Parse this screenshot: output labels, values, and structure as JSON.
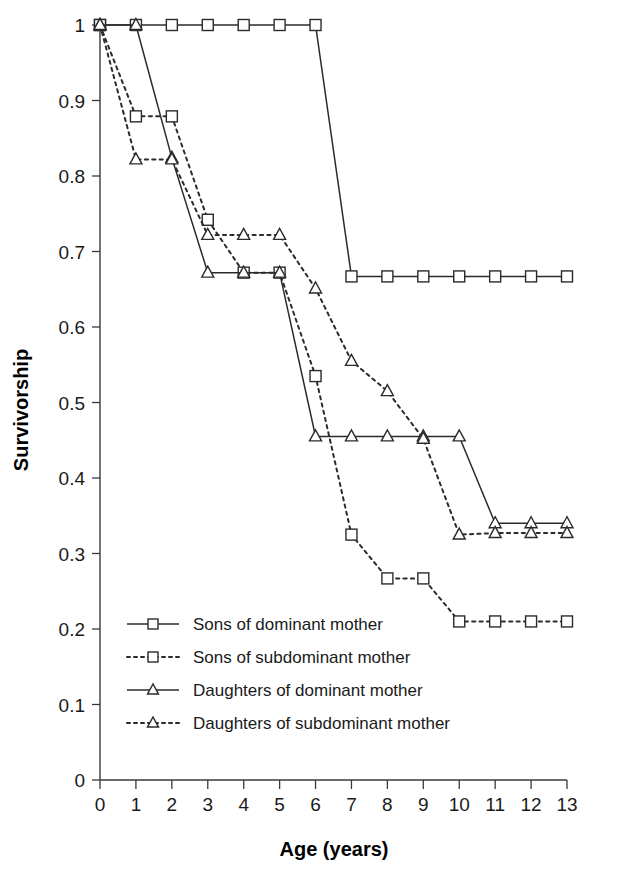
{
  "chart_data": {
    "type": "line",
    "title": "",
    "xlabel": "Age (years)",
    "ylabel": "Survivorship",
    "xlim": [
      0,
      13
    ],
    "ylim": [
      0,
      1
    ],
    "xticks": [
      "0",
      "1",
      "2",
      "3",
      "4",
      "5",
      "6",
      "7",
      "8",
      "9",
      "10",
      "11",
      "12",
      "13"
    ],
    "yticks": [
      "0",
      "0.1",
      "0.2",
      "0.3",
      "0.4",
      "0.5",
      "0.6",
      "0.7",
      "0.8",
      "0.9",
      "1"
    ],
    "grid": false,
    "legend_position": "inside lower left",
    "x": [
      0,
      1,
      2,
      3,
      4,
      5,
      6,
      7,
      8,
      9,
      10,
      11,
      12,
      13
    ],
    "series": [
      {
        "name": "Sons of dominant mother",
        "marker": "square",
        "linestyle": "solid",
        "values": [
          1.0,
          1.0,
          1.0,
          1.0,
          1.0,
          1.0,
          1.0,
          0.667,
          0.667,
          0.667,
          0.667,
          0.667,
          0.667,
          0.667
        ]
      },
      {
        "name": "Sons of subdominant mother",
        "marker": "square",
        "linestyle": "dotted",
        "values": [
          1.0,
          0.879,
          0.879,
          0.742,
          0.672,
          0.672,
          0.535,
          0.325,
          0.267,
          0.267,
          0.21,
          0.21,
          0.21,
          0.21
        ]
      },
      {
        "name": "Daughters of dominant mother",
        "marker": "triangle",
        "linestyle": "solid",
        "values": [
          1.0,
          1.0,
          0.824,
          0.672,
          0.672,
          0.672,
          0.455,
          0.455,
          0.455,
          0.455,
          0.455,
          0.34,
          0.34,
          0.34
        ]
      },
      {
        "name": "Daughters of subdominant mother",
        "marker": "triangle",
        "linestyle": "dotted",
        "values": [
          1.0,
          0.822,
          0.822,
          0.722,
          0.722,
          0.722,
          0.651,
          0.555,
          0.515,
          0.452,
          0.325,
          0.327,
          0.327,
          0.327
        ]
      }
    ]
  },
  "legend": {
    "entries": [
      {
        "label": "Sons of dominant mother",
        "marker": "square",
        "linestyle": "solid"
      },
      {
        "label": "Sons of subdominant mother",
        "marker": "square",
        "linestyle": "dotted"
      },
      {
        "label": "Daughters of dominant mother",
        "marker": "triangle",
        "linestyle": "solid"
      },
      {
        "label": "Daughters of subdominant mother",
        "marker": "triangle",
        "linestyle": "dotted"
      }
    ]
  },
  "colors": {
    "line": "#2b2b2b",
    "axis": "#3a3a3a",
    "text": "#1a1a1a",
    "background": "#ffffff"
  }
}
